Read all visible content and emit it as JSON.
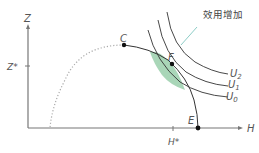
{
  "diagram": {
    "axes": {
      "y_label": "Z",
      "x_label": "H",
      "y_tick_label": "Z*",
      "x_tick_label": "H*"
    },
    "points": {
      "c": "C",
      "f": "F",
      "e": "E"
    },
    "curves": {
      "u0": "U",
      "u0_sub": "0",
      "u1": "U",
      "u1_sub": "1",
      "u2": "U",
      "u2_sub": "2"
    },
    "annotation": "效用增加",
    "colors": {
      "axis": "#666666",
      "curve": "#333333",
      "dotted": "#aaaaaa",
      "shaded_region": "#9fd0b0",
      "arrow_line": "#7fc6c0"
    }
  }
}
